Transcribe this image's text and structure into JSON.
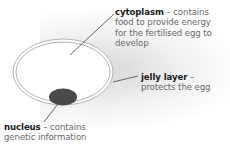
{
  "diagram": {
    "labels": [
      {
        "term": "cytoplasm",
        "separator": " – ",
        "description_lines": [
          "contains",
          "food to provide energy",
          "for the fertilised egg to",
          "develop"
        ]
      },
      {
        "term": "jelly layer",
        "separator": " –",
        "description_lines": [
          "protects the egg"
        ]
      },
      {
        "term": "nucleus",
        "separator": " – ",
        "description_lines": [
          "contains",
          "genetic information"
        ]
      }
    ],
    "colors": {
      "outline": "#b0b0b0",
      "nucleus": "#4a4a4a",
      "leader_line": "#444444",
      "term_text": "#1a1a1a",
      "description_text": "#6a6a6a"
    }
  }
}
